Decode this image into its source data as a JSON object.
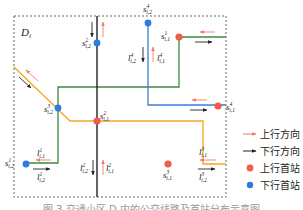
{
  "diagram": {
    "region_label": "D",
    "region_subscript": "i",
    "colors": {
      "boundary": "#555555",
      "black_line": "#222222",
      "blue_line": "#3b7ddd",
      "green_line": "#3a8a3a",
      "orange_line": "#f5a623",
      "up_arrow": "#f47a6a",
      "down_arrow": "#222222",
      "up_station": "#f25c4b",
      "down_station": "#2f7ae0"
    },
    "stations": [
      {
        "id": "s1_i1",
        "label": "s",
        "sup": "1",
        "sub": "i,1",
        "type": "up"
      },
      {
        "id": "s2_i1",
        "label": "s",
        "sup": "2",
        "sub": "i,1",
        "type": "up"
      },
      {
        "id": "s3_i1",
        "label": "s",
        "sup": "3",
        "sub": "i,1",
        "type": "up"
      },
      {
        "id": "s4_i1",
        "label": "s",
        "sup": "4",
        "sub": "i,1",
        "type": "up"
      },
      {
        "id": "s1_i2",
        "label": "s",
        "sup": "1",
        "sub": "i,2",
        "type": "down"
      },
      {
        "id": "s2_i2",
        "label": "s",
        "sup": "2",
        "sub": "i,2",
        "type": "down"
      },
      {
        "id": "s3_i2",
        "label": "s",
        "sup": "3",
        "sub": "i,2",
        "type": "down"
      },
      {
        "id": "s4_i2",
        "label": "s",
        "sup": "4",
        "sub": "i,2",
        "type": "down"
      }
    ],
    "lines": [
      {
        "id": "l1_i1",
        "label": "l",
        "sup": "1",
        "sub": "i,1"
      },
      {
        "id": "l1_i2",
        "label": "l",
        "sup": "1",
        "sub": "i,2"
      },
      {
        "id": "l2_i1",
        "label": "l",
        "sup": "2",
        "sub": "i,1"
      },
      {
        "id": "l2_i2",
        "label": "l",
        "sup": "2",
        "sub": "i,2"
      },
      {
        "id": "l3_i1",
        "label": "l",
        "sup": "3",
        "sub": "i,1"
      },
      {
        "id": "l3_i2",
        "label": "l",
        "sup": "3",
        "sub": "i,2"
      },
      {
        "id": "l4_i1",
        "label": "l",
        "sup": "4",
        "sub": "i,1"
      },
      {
        "id": "l4_i2",
        "label": "l",
        "sup": "4",
        "sub": "i,2"
      }
    ]
  },
  "legend": {
    "items": [
      {
        "label": "上行方向",
        "kind": "up-arrow"
      },
      {
        "label": "下行方向",
        "kind": "down-arrow"
      },
      {
        "label": "上行首站",
        "kind": "up-station"
      },
      {
        "label": "下行首站",
        "kind": "down-station"
      }
    ]
  },
  "caption": "图 3  交通小区 D 内的公交线路及首站分布示意图"
}
